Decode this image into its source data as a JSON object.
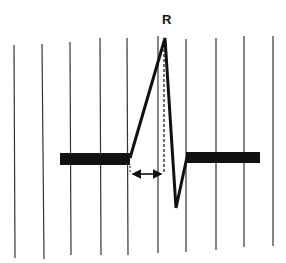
{
  "diagram": {
    "peak_label": "R",
    "components": [
      "vertical grid lines",
      "isoelectric baseline",
      "R wave upstroke",
      "S wave",
      "dashed perpendicular from R peak",
      "double-headed arrow measuring onset-to-peak interval"
    ],
    "grid_line_count": 10,
    "colors": {
      "ink": "#111111",
      "grid": "#333333",
      "background": "#ffffff"
    }
  }
}
